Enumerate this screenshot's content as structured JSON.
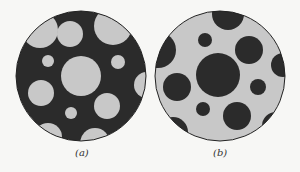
{
  "figure": {
    "panels": [
      {
        "id": "a",
        "label": "(a)",
        "background_color": "#2b2b2b",
        "disk_color": "#c8c8c8",
        "outer": {
          "cx": 81,
          "cy": 76,
          "r": 65
        },
        "disks": [
          {
            "cx": 40,
            "cy": 30,
            "r": 18
          },
          {
            "cx": 70,
            "cy": 34,
            "r": 13
          },
          {
            "cx": 113,
            "cy": 26,
            "r": 19
          },
          {
            "cx": 48,
            "cy": 61,
            "r": 6
          },
          {
            "cx": 81,
            "cy": 76,
            "r": 20
          },
          {
            "cx": 118,
            "cy": 62,
            "r": 7
          },
          {
            "cx": 147,
            "cy": 85,
            "r": 13
          },
          {
            "cx": 41,
            "cy": 93,
            "r": 13
          },
          {
            "cx": 107,
            "cy": 106,
            "r": 13
          },
          {
            "cx": 71,
            "cy": 113,
            "r": 6
          },
          {
            "cx": 48,
            "cy": 137,
            "r": 14
          },
          {
            "cx": 95,
            "cy": 143,
            "r": 15
          }
        ]
      },
      {
        "id": "b",
        "label": "(b)",
        "background_color": "#c8c8c8",
        "disk_color": "#2b2b2b",
        "outer": {
          "cx": 220,
          "cy": 76,
          "r": 65
        },
        "disks": [
          {
            "cx": 228,
            "cy": 14,
            "r": 16
          },
          {
            "cx": 158,
            "cy": 50,
            "r": 18
          },
          {
            "cx": 205,
            "cy": 40,
            "r": 7
          },
          {
            "cx": 249,
            "cy": 50,
            "r": 14
          },
          {
            "cx": 283,
            "cy": 65,
            "r": 12
          },
          {
            "cx": 218,
            "cy": 75,
            "r": 22
          },
          {
            "cx": 177,
            "cy": 87,
            "r": 14
          },
          {
            "cx": 258,
            "cy": 87,
            "r": 8
          },
          {
            "cx": 203,
            "cy": 109,
            "r": 7
          },
          {
            "cx": 237,
            "cy": 116,
            "r": 14
          },
          {
            "cx": 173,
            "cy": 132,
            "r": 15
          },
          {
            "cx": 276,
            "cy": 126,
            "r": 14
          }
        ]
      }
    ]
  }
}
